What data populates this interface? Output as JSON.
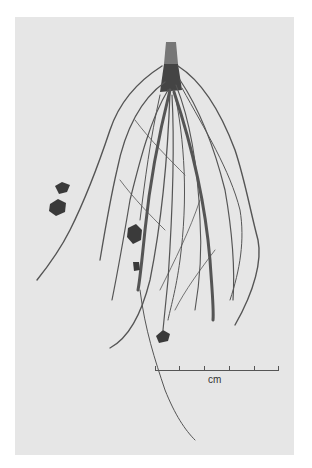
{
  "figure": {
    "background_color": "#e6e6e6",
    "root_color": "#555555"
  },
  "scale_bar": {
    "unit_label": "cm",
    "tick_count": 6
  }
}
